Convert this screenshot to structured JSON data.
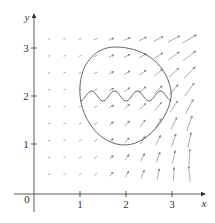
{
  "figure": {
    "type": "vector-field-plot",
    "axes": {
      "x_label": "x",
      "y_label": "y",
      "origin_label": "0",
      "x_ticks": [
        "1",
        "2",
        "3"
      ],
      "y_ticks": [
        "1",
        "2",
        "3"
      ]
    },
    "curves": [
      {
        "name": "closed-curve",
        "description": "closed curve enclosing region"
      },
      {
        "name": "wavy-curve",
        "description": "oscillating curve crossing the region horizontally near y = 2"
      }
    ],
    "vector_field": {
      "rows": 9,
      "cols": 10,
      "description": "arrows grow longer and steeper toward larger x"
    },
    "colors": {
      "axis": "#333333",
      "curve": "#555555",
      "arrow": "#888888"
    }
  }
}
